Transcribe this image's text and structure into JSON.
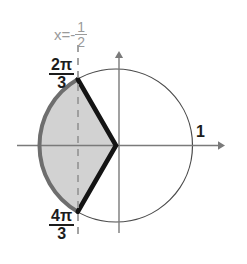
{
  "figure": {
    "background_color": "#ffffff",
    "axes": {
      "x_axis": {
        "from_x": 17,
        "to_x": 224,
        "y": 145.5,
        "color": "#7a7a7a",
        "arrow": "right"
      },
      "y_axis": {
        "x": 119,
        "from_y": 232,
        "to_y": 52,
        "color": "#7a7a7a",
        "arrow": "up"
      }
    },
    "circle": {
      "center_x": 116,
      "center_y": 145.5,
      "radius": 76.5,
      "stroke_color": "#4a4a4a",
      "stroke_width": 1.2,
      "fill": "none",
      "radius_label": "1"
    },
    "vertical_line": {
      "label_text": "x=-",
      "label_numerator": "1",
      "label_denominator": "2",
      "x_value": -0.5,
      "pixel_x": 78,
      "from_y": 45,
      "to_y": 240,
      "style": "dashed",
      "color": "#9a9a9a"
    },
    "angles": {
      "upper": {
        "numerator": "2π",
        "denominator": "3",
        "radians_label": "2π/3",
        "degrees": 120
      },
      "lower": {
        "numerator": "4π",
        "denominator": "3",
        "radians_label": "4π/3",
        "degrees": 240
      }
    },
    "shaded_region": {
      "description": "circular segment plus triangle between 2pi/3 and 4pi/3",
      "fill_color": "#d2d2d2",
      "arc_stroke_color": "#6e6e6e",
      "arc_stroke_width": 4,
      "chord_stroke_color": "#141414",
      "chord_stroke_width": 4.5
    }
  }
}
